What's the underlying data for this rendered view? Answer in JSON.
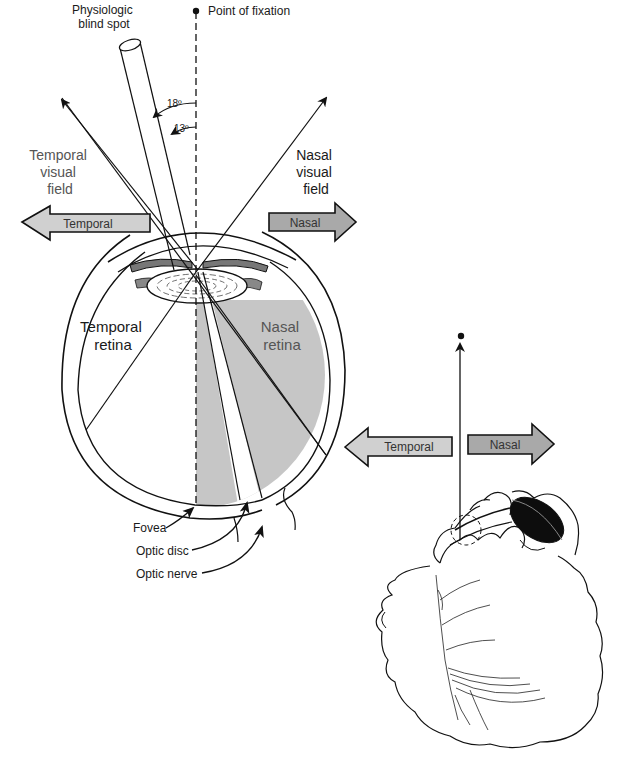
{
  "figure": {
    "eye_diagram": {
      "blind_spot_label_line1": "Physiologic",
      "blind_spot_label_line2": "blind spot",
      "fixation_label": "Point of fixation",
      "angle_outer": "18º",
      "angle_inner": "13º",
      "temporal_field_line1": "Temporal",
      "temporal_field_line2": "visual",
      "temporal_field_line3": "field",
      "nasal_field_line1": "Nasal",
      "nasal_field_line2": "visual",
      "nasal_field_line3": "field",
      "temporal_arrow_label": "Temporal",
      "nasal_arrow_label": "Nasal",
      "temporal_retina_line1": "Temporal",
      "temporal_retina_line2": "retina",
      "nasal_retina_line1": "Nasal",
      "nasal_retina_line2": "retina",
      "fovea_label": "Fovea",
      "optic_disc_label": "Optic disc",
      "optic_nerve_label": "Optic nerve"
    },
    "head_diagram": {
      "temporal_arrow_label": "Temporal",
      "nasal_arrow_label": "Nasal"
    },
    "colors": {
      "temporal_arrow_fill": "#d0d0d0",
      "nasal_arrow_fill": "#a9a9a9",
      "nasal_retina_fill": "#c6c6c6",
      "line": "#111111",
      "eye_patch": "#0d0d0d"
    }
  }
}
